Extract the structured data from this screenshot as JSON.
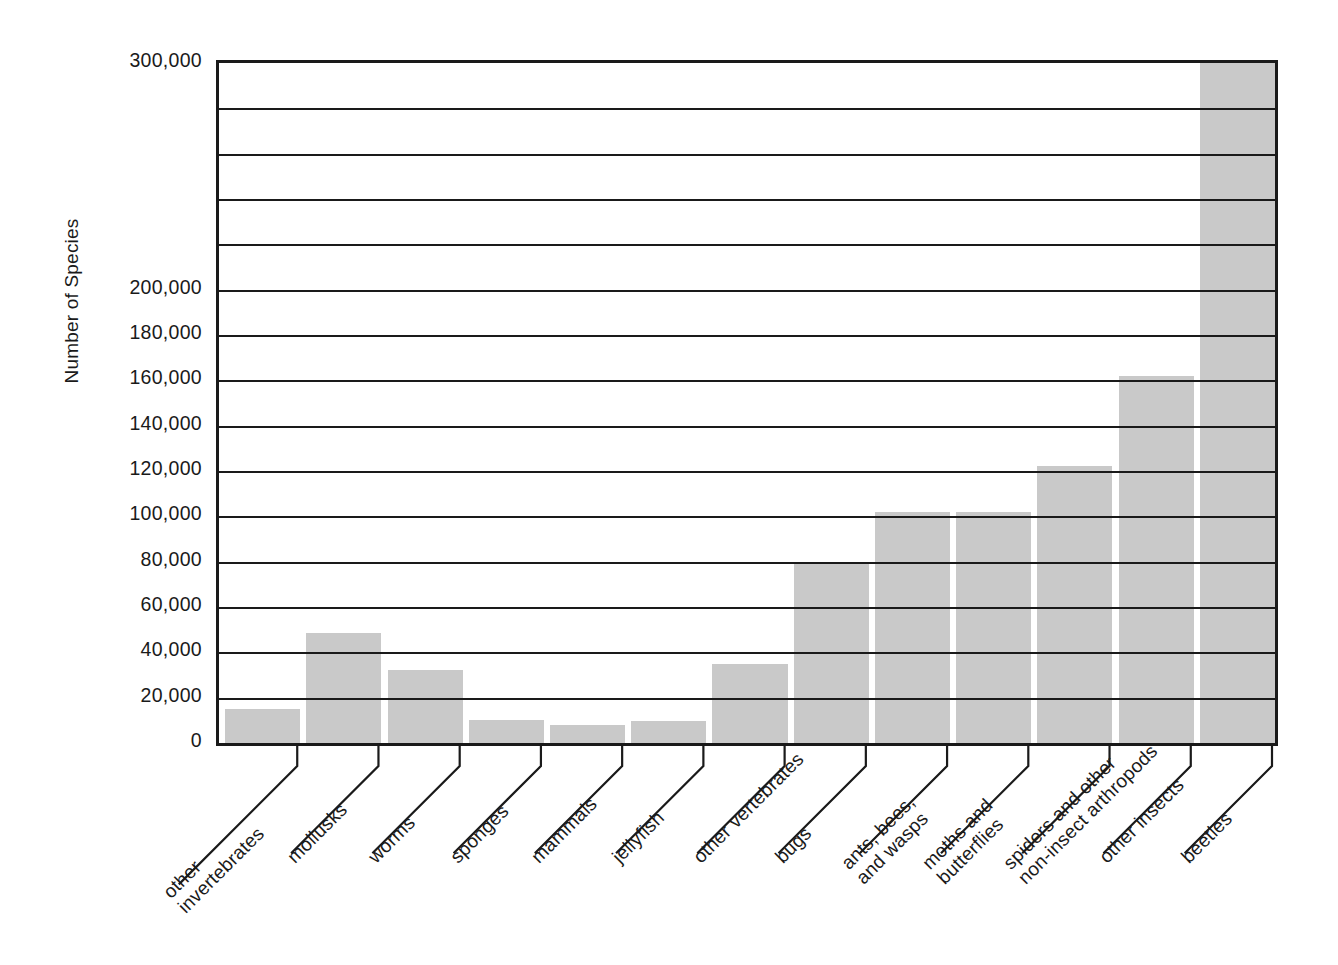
{
  "chart_data": {
    "type": "bar",
    "title": "",
    "xlabel": "",
    "ylabel": "Number of Species",
    "ylim": [
      0,
      300000
    ],
    "ytick_step": 20000,
    "grid": true,
    "legend": "none",
    "bar_color": "#c9c9c9",
    "axis_color": "#1a1a1a",
    "yticks": [
      {
        "value": 0,
        "label": "0"
      },
      {
        "value": 20000,
        "label": "20,000"
      },
      {
        "value": 40000,
        "label": "40,000"
      },
      {
        "value": 60000,
        "label": "60,000"
      },
      {
        "value": 80000,
        "label": "80,000"
      },
      {
        "value": 100000,
        "label": "100,000"
      },
      {
        "value": 120000,
        "label": "120,000"
      },
      {
        "value": 140000,
        "label": "140,000"
      },
      {
        "value": 160000,
        "label": "160,000"
      },
      {
        "value": 180000,
        "label": "180,000"
      },
      {
        "value": 200000,
        "label": "200,000"
      },
      {
        "value": 220000,
        "label": ""
      },
      {
        "value": 240000,
        "label": ""
      },
      {
        "value": 260000,
        "label": ""
      },
      {
        "value": 280000,
        "label": ""
      },
      {
        "value": 300000,
        "label": "300,000"
      }
    ],
    "categories": [
      "other invertebrates",
      "mollusks",
      "worms",
      "sponges",
      "mammals",
      "jellyfish",
      "other vertebrates",
      "bugs",
      "ants, bees, and wasps",
      "moths and butterflies",
      "spiders and other non-insect arthropods",
      "other insects",
      "beetles"
    ],
    "category_lines": [
      [
        "other",
        "invertebrates"
      ],
      [
        "mollusks",
        ""
      ],
      [
        "worms",
        ""
      ],
      [
        "sponges",
        ""
      ],
      [
        "mammals",
        ""
      ],
      [
        "jellyfish",
        ""
      ],
      [
        "other vertebrates",
        ""
      ],
      [
        "bugs",
        ""
      ],
      [
        "ants, bees,",
        "and wasps"
      ],
      [
        "moths and",
        "butterflies"
      ],
      [
        "spiders and other",
        "non-insect arthropods"
      ],
      [
        "other insects",
        ""
      ],
      [
        "beetles",
        ""
      ]
    ],
    "values": [
      15000,
      48500,
      32000,
      10000,
      8000,
      9500,
      35000,
      80000,
      102000,
      102000,
      122000,
      162000,
      300000
    ]
  }
}
